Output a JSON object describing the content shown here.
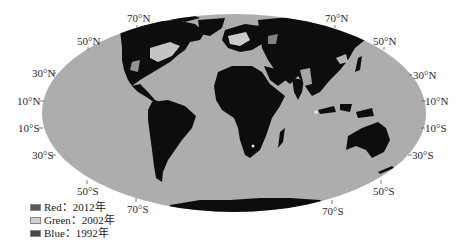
{
  "map": {
    "projection": "mollweide-like",
    "colors": {
      "ocean": "#adadad",
      "land": "#0d0d0d",
      "lights": "#f2f2f2",
      "lights_dim": "#c8c8c8"
    }
  },
  "latitude_labels": {
    "left": [
      {
        "text": "70°N",
        "x": 127,
        "y": 13
      },
      {
        "text": "50°N",
        "x": 77,
        "y": 36
      },
      {
        "text": "30°N",
        "x": 32,
        "y": 68
      },
      {
        "text": "10°N",
        "x": 17,
        "y": 96
      },
      {
        "text": "10°S",
        "x": 18,
        "y": 123
      },
      {
        "text": "30°S",
        "x": 32,
        "y": 150
      },
      {
        "text": "50°S",
        "x": 77,
        "y": 186
      },
      {
        "text": "70°S",
        "x": 127,
        "y": 204
      }
    ],
    "right": [
      {
        "text": "70°N",
        "x": 325,
        "y": 13
      },
      {
        "text": "50°N",
        "x": 373,
        "y": 36
      },
      {
        "text": "30°N",
        "x": 413,
        "y": 70
      },
      {
        "text": "10°N",
        "x": 425,
        "y": 96
      },
      {
        "text": "10°S",
        "x": 425,
        "y": 123
      },
      {
        "text": "30°S",
        "x": 412,
        "y": 150
      },
      {
        "text": "50°S",
        "x": 373,
        "y": 186
      },
      {
        "text": "70°S",
        "x": 322,
        "y": 206
      }
    ]
  },
  "legend": {
    "items": [
      {
        "label": "Red：2012年",
        "swatch": "#5a5a5a"
      },
      {
        "label": "Green：2002年",
        "swatch": "#cfcfcf"
      },
      {
        "label": "Blue：1992年",
        "swatch": "#474747"
      }
    ]
  }
}
